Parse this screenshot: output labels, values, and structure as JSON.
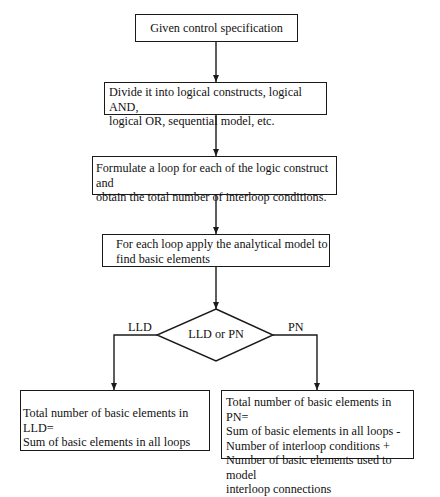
{
  "diagram": {
    "type": "flowchart",
    "nodes": {
      "start": {
        "text": "Given control specification"
      },
      "divide": {
        "text": "Divide it into logical constructs, logical AND,\nlogical OR, sequential model, etc."
      },
      "formulate": {
        "text": "Formulate a loop for each of the logic construct and\nobtain the total number of interloop conditions."
      },
      "apply": {
        "text": "For each loop apply the analytical model to\nfind basic elements"
      },
      "decision": {
        "text": "LLD or PN"
      },
      "lld_result": {
        "text": "Total number of basic elements in LLD=\nSum of basic elements in all loops"
      },
      "pn_result": {
        "text": "Total number of basic elements in PN=\nSum of basic elements in all loops -\nNumber of interloop conditions +\nNumber of basic elements used to model\ninterloop connections"
      }
    },
    "edges": {
      "left_branch_label": "LLD",
      "right_branch_label": "PN"
    },
    "colors": {
      "stroke": "#1a1a1a",
      "background": "#ffffff"
    }
  }
}
